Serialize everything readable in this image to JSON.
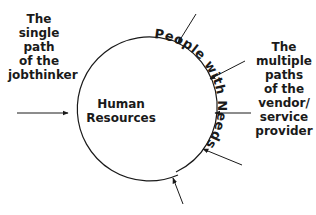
{
  "left_label": [
    "The",
    "single",
    "path",
    "of the",
    "jobthinker"
  ],
  "right_label": [
    "The",
    "multiple",
    "paths",
    "of the",
    "vendor/",
    "service",
    "provider"
  ],
  "center_label": [
    "Human",
    "Resources"
  ],
  "arc_text": "People with Needs",
  "colors": {
    "line": "#1a1a1a",
    "text": "#1a1a1a",
    "background": "#ffffff"
  },
  "arrows": {
    "left_count": 1,
    "right_count": 5
  }
}
